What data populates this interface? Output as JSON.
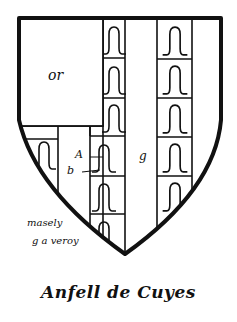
{
  "shield": {
    "fields": {
      "canton_tincture": "or",
      "label_a": "A",
      "label_b": "b",
      "pale_tincture": "g"
    },
    "notes": {
      "line1": "masely",
      "line2": "g a veroy"
    },
    "caption": "Anfell de Cuyes",
    "colors": {
      "ink": "#111111",
      "background": "#ffffff"
    }
  }
}
